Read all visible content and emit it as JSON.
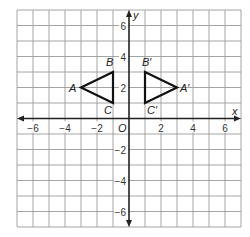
{
  "diagram": {
    "type": "coordinate-plane",
    "grid": {
      "x_min": -7,
      "x_max": 7,
      "y_min": -7,
      "y_max": 7,
      "step": 1
    },
    "axes": {
      "x_label": "x",
      "y_label": "y",
      "origin_label": "O"
    },
    "x_ticks": [
      {
        "value": -6,
        "label": "−6"
      },
      {
        "value": -4,
        "label": "−4"
      },
      {
        "value": -2,
        "label": "−2"
      },
      {
        "value": 2,
        "label": "2"
      },
      {
        "value": 4,
        "label": "4"
      },
      {
        "value": 6,
        "label": "6"
      }
    ],
    "y_ticks": [
      {
        "value": 6,
        "label": "6"
      },
      {
        "value": 4,
        "label": "4"
      },
      {
        "value": 2,
        "label": "2"
      },
      {
        "value": -2,
        "label": "−2"
      },
      {
        "value": -4,
        "label": "−4"
      },
      {
        "value": -6,
        "label": "−6"
      }
    ],
    "triangles": [
      {
        "name": "original",
        "vertices": [
          {
            "label": "A",
            "x": -3,
            "y": 2,
            "dx": -12,
            "dy": 4
          },
          {
            "label": "B",
            "x": -1,
            "y": 3,
            "dx": -7,
            "dy": -6
          },
          {
            "label": "C",
            "x": -1,
            "y": 1,
            "dx": -9,
            "dy": 11
          }
        ]
      },
      {
        "name": "image",
        "vertices": [
          {
            "label": "A′",
            "x": 3,
            "y": 2,
            "dx": 3,
            "dy": 4
          },
          {
            "label": "B′",
            "x": 1,
            "y": 3,
            "dx": -3,
            "dy": -6
          },
          {
            "label": "C′",
            "x": 1,
            "y": 1,
            "dx": 2,
            "dy": 11
          }
        ]
      }
    ],
    "colors": {
      "grid": "#9a9a9a",
      "axis": "#222222",
      "triangle": "#111111",
      "background": "#ffffff"
    }
  }
}
